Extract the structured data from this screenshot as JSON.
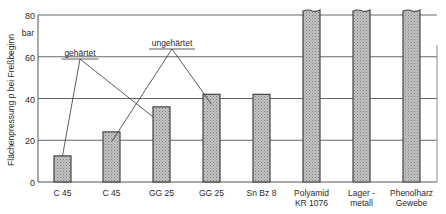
{
  "chart_data": {
    "type": "bar",
    "title": "",
    "xlabel": "",
    "ylabel": "Flächenpressung p bei Freßbeginn",
    "yunit": "bar",
    "ylim": [
      0,
      80
    ],
    "yticks": [
      0,
      20,
      40,
      60,
      80
    ],
    "grid": true,
    "categories": [
      [
        "C 45"
      ],
      [
        "C 45"
      ],
      [
        "GG 25"
      ],
      [
        "GG 25"
      ],
      [
        "Sn Bz 8"
      ],
      [
        "Polyamid",
        "KR 1076"
      ],
      [
        "Lager -",
        "metall"
      ],
      [
        "Phenolharz",
        "Gewebe"
      ]
    ],
    "values": [
      12.5,
      24,
      36,
      42,
      42,
      80,
      80,
      80
    ],
    "truncated_above_axis": [
      false,
      false,
      false,
      false,
      false,
      true,
      true,
      true
    ],
    "annotations": [
      {
        "text": "gehärtet",
        "points_to": [
          0,
          2
        ]
      },
      {
        "text": "ungehärtet",
        "points_to": [
          1,
          3
        ]
      }
    ],
    "colors": {
      "bar_fill": "#b5b5b5",
      "bar_edge": "#444444",
      "grid": "#666666"
    }
  }
}
